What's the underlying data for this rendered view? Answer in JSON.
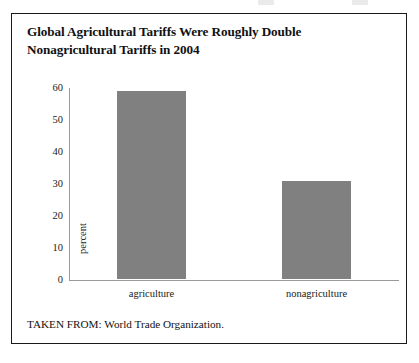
{
  "figure": {
    "title_line1": "Global Agricultural Tariffs Were Roughly Double",
    "title_line2": "Nonagricultural Tariffs in 2004",
    "source_note": "TAKEN FROM: World Trade Organization.",
    "border_color": "#1a1a1a",
    "background_color": "#ffffff"
  },
  "chart_data": {
    "type": "bar",
    "title": "Global Agricultural Tariffs Were Roughly Double Nonagricultural Tariffs in 2004",
    "categories": [
      "agriculture",
      "nonagriculture"
    ],
    "values": [
      58.6,
      30.5
    ],
    "series": [
      {
        "name": "tariff rate",
        "values": [
          58.6,
          30.5
        ]
      }
    ],
    "xlabel": "",
    "ylabel": "percent",
    "ylim": [
      0,
      60
    ],
    "ytick_labels": [
      "60",
      "50",
      "40",
      "30",
      "20",
      "10",
      "0"
    ],
    "ytick_values": [
      60,
      50,
      40,
      30,
      20,
      10,
      0
    ],
    "ytick_step": 10,
    "grid": false,
    "legend": false,
    "legend_position": "none",
    "bar_color": "#808080",
    "axis_color": "#9a9a9a",
    "annotations": []
  }
}
